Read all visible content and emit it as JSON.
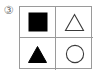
{
  "figure": {
    "item_number_label": "③",
    "background_color": "#ffffff",
    "line_color": "#9a9a9a",
    "shape_fill_color": "#000000",
    "shape_stroke_color": "#3a3a3a",
    "grid": {
      "rows": 2,
      "columns": 2,
      "cells": [
        {
          "position": "top-left",
          "shape": "square",
          "style": "filled",
          "fill": "#000000",
          "stroke": "#000000"
        },
        {
          "position": "top-right",
          "shape": "triangle",
          "style": "outline",
          "fill": "none",
          "stroke": "#3a3a3a"
        },
        {
          "position": "bottom-left",
          "shape": "triangle",
          "style": "filled",
          "fill": "#000000",
          "stroke": "#000000"
        },
        {
          "position": "bottom-right",
          "shape": "circle",
          "style": "outline",
          "fill": "none",
          "stroke": "#3a3a3a"
        }
      ]
    }
  }
}
